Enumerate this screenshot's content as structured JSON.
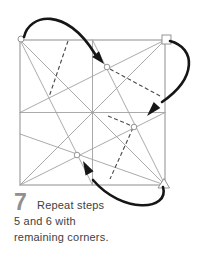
{
  "step": {
    "number": "7",
    "lines": [
      "Repeat steps",
      "5 and 6 with",
      "remaining corners."
    ]
  },
  "diagram": {
    "markers": {
      "top_left_corner": "circle",
      "top_right_corner": "square",
      "bottom_right_corner": "triangle",
      "fold_target_points": "circle"
    },
    "arrow_count": 3,
    "fold_arrows": [
      {
        "from": "top-left-corner",
        "to": "upper-fold-point"
      },
      {
        "from": "top-right-corner",
        "to": "right-fold-point"
      },
      {
        "from": "bottom-right-corner",
        "to": "lower-fold-point"
      }
    ]
  },
  "colors": {
    "background": "#ffffff",
    "square_edge": "#8d8d8d",
    "crease_line": "#a0a0a0",
    "dashed_fold_line": "#4a4a4a",
    "arrow": "#161616",
    "step_number": "#909090",
    "caption_text": "#3e3e3e"
  }
}
